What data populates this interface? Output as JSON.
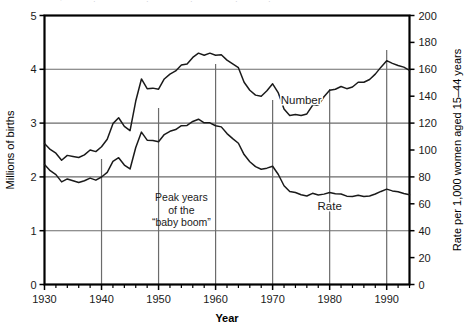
{
  "chart_data": {
    "type": "line",
    "title": "",
    "xlabel": "Year",
    "ylabel": "Millions of births",
    "y2label": "Rate per 1,000 women aged 15–44 years",
    "xlim": [
      1930,
      1994
    ],
    "ylim": [
      0,
      5
    ],
    "y2lim": [
      0,
      200
    ],
    "grid": true,
    "legend_position": "inline-annotation",
    "x_ticks": [
      1930,
      1940,
      1950,
      1960,
      1970,
      1980,
      1990
    ],
    "x_tick_labels": [
      "1930",
      "1940",
      "1950",
      "1960",
      "1970",
      "1980",
      "1990"
    ],
    "x_minor_tick_interval": 2,
    "y_ticks": [
      0,
      1,
      2,
      3,
      4,
      5
    ],
    "y_tick_labels": [
      "0",
      "1",
      "2",
      "3",
      "4",
      "5"
    ],
    "y2_ticks": [
      0,
      20,
      40,
      60,
      80,
      100,
      120,
      140,
      160,
      180,
      200
    ],
    "y2_tick_labels": [
      "0",
      "20",
      "40",
      "60",
      "80",
      "100",
      "120",
      "140",
      "160",
      "180",
      "200"
    ],
    "annotations": [
      {
        "name": "baby-boom-note",
        "lines": [
          "Peak years",
          "of the",
          "“baby boom”"
        ],
        "x": 1954,
        "y": 1.55
      },
      {
        "name": "number-series-label",
        "text": "Number",
        "x": 1975,
        "y": 3.35
      },
      {
        "name": "rate-series-label",
        "text": "Rate",
        "x": 1980,
        "y": 1.38
      }
    ],
    "x": [
      1930,
      1931,
      1932,
      1933,
      1934,
      1935,
      1936,
      1937,
      1938,
      1939,
      1940,
      1941,
      1942,
      1943,
      1944,
      1945,
      1946,
      1947,
      1948,
      1949,
      1950,
      1951,
      1952,
      1953,
      1954,
      1955,
      1956,
      1957,
      1958,
      1959,
      1960,
      1961,
      1962,
      1963,
      1964,
      1965,
      1966,
      1967,
      1968,
      1969,
      1970,
      1971,
      1972,
      1973,
      1974,
      1975,
      1976,
      1977,
      1978,
      1979,
      1980,
      1981,
      1982,
      1983,
      1984,
      1985,
      1986,
      1987,
      1988,
      1989,
      1990,
      1991,
      1992,
      1993,
      1994
    ],
    "series": [
      {
        "name": "Number",
        "axis": "left",
        "unit": "millions of births",
        "values": [
          2.62,
          2.51,
          2.44,
          2.31,
          2.4,
          2.38,
          2.36,
          2.41,
          2.5,
          2.47,
          2.56,
          2.7,
          2.99,
          3.1,
          2.94,
          2.86,
          3.41,
          3.82,
          3.64,
          3.65,
          3.63,
          3.82,
          3.91,
          3.97,
          4.08,
          4.1,
          4.22,
          4.3,
          4.26,
          4.3,
          4.26,
          4.27,
          4.17,
          4.1,
          4.03,
          3.76,
          3.61,
          3.52,
          3.5,
          3.6,
          3.73,
          3.56,
          3.26,
          3.14,
          3.16,
          3.14,
          3.17,
          3.33,
          3.33,
          3.49,
          3.61,
          3.63,
          3.68,
          3.64,
          3.67,
          3.76,
          3.76,
          3.81,
          3.91,
          4.04,
          4.16,
          4.11,
          4.07,
          4.04,
          3.98
        ]
      },
      {
        "name": "Rate",
        "axis": "right",
        "unit": "births per 1,000 women aged 15-44",
        "values": [
          89.2,
          84.6,
          81.7,
          76.3,
          78.5,
          77.2,
          75.8,
          77.1,
          79.1,
          77.6,
          79.9,
          83.4,
          91.5,
          94.3,
          88.8,
          85.9,
          101.9,
          113.3,
          107.3,
          107.1,
          106.2,
          111.5,
          113.9,
          115.2,
          118.1,
          118.3,
          121.2,
          122.9,
          120.2,
          120.2,
          118.0,
          117.2,
          112.2,
          108.5,
          105.0,
          96.6,
          91.3,
          87.6,
          85.7,
          86.5,
          87.9,
          81.8,
          73.4,
          69.2,
          68.4,
          66.7,
          65.8,
          67.8,
          66.6,
          67.2,
          68.4,
          67.4,
          67.3,
          65.7,
          65.5,
          66.3,
          65.4,
          65.8,
          67.3,
          69.2,
          70.9,
          69.6,
          68.9,
          67.6,
          66.7
        ]
      }
    ]
  },
  "cropped_header_text": "",
  "colors": {
    "line": "#1a1a1a",
    "grid": "#6b6b6b",
    "frame": "#000000",
    "background": "#ffffff"
  }
}
